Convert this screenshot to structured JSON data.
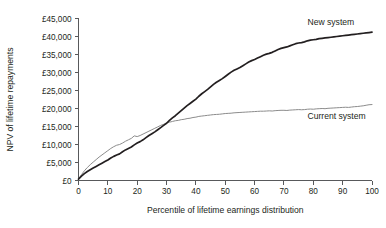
{
  "chart_data": {
    "type": "line",
    "title": "",
    "xlabel": "Percentile of lifetime earnings distribution",
    "ylabel": "NPV of lifetime repayments",
    "xlim": [
      0,
      100
    ],
    "ylim": [
      0,
      45000
    ],
    "grid": false,
    "legend_position": "inline-right",
    "x_ticks": [
      0,
      10,
      20,
      30,
      40,
      50,
      60,
      70,
      80,
      90,
      100
    ],
    "x_tick_labels": [
      "0",
      "10",
      "20",
      "30",
      "40",
      "50",
      "60",
      "70",
      "80",
      "90",
      "100"
    ],
    "y_ticks": [
      0,
      5000,
      10000,
      15000,
      20000,
      25000,
      30000,
      35000,
      40000,
      45000
    ],
    "y_tick_labels": [
      "£0",
      "£5,000",
      "£10,000",
      "£15,000",
      "£20,000",
      "£25,000",
      "£30,000",
      "£35,000",
      "£40,000",
      "£45,000"
    ],
    "series": [
      {
        "name": "New system",
        "color": "#231f20",
        "label_x": 78,
        "label_y": 43200,
        "x": [
          0,
          1,
          2,
          3,
          4,
          5,
          6,
          7,
          8,
          9,
          10,
          11,
          12,
          13,
          14,
          15,
          16,
          17,
          18,
          19,
          20,
          21,
          22,
          23,
          24,
          25,
          26,
          27,
          28,
          29,
          30,
          31,
          32,
          33,
          34,
          35,
          36,
          37,
          38,
          39,
          40,
          41,
          42,
          43,
          44,
          45,
          46,
          47,
          48,
          49,
          50,
          51,
          52,
          53,
          54,
          55,
          56,
          57,
          58,
          59,
          60,
          61,
          62,
          63,
          64,
          65,
          66,
          67,
          68,
          69,
          70,
          71,
          72,
          73,
          74,
          75,
          76,
          77,
          78,
          79,
          80,
          81,
          82,
          83,
          84,
          85,
          86,
          87,
          88,
          89,
          90,
          91,
          92,
          93,
          94,
          95,
          96,
          97,
          98,
          99,
          100
        ],
        "y": [
          400,
          1200,
          1900,
          2500,
          3000,
          3450,
          3900,
          4350,
          4800,
          5250,
          5700,
          6250,
          6700,
          7100,
          7400,
          8000,
          8500,
          8900,
          9300,
          9900,
          10400,
          10800,
          11300,
          11900,
          12500,
          13000,
          13500,
          14100,
          14700,
          15300,
          15900,
          16700,
          17400,
          18000,
          18700,
          19400,
          20100,
          20800,
          21400,
          22000,
          22600,
          23400,
          24100,
          24700,
          25300,
          26000,
          26700,
          27300,
          27800,
          28300,
          28900,
          29500,
          30100,
          30600,
          31000,
          31400,
          31900,
          32400,
          32900,
          33300,
          33600,
          34000,
          34400,
          34800,
          35100,
          35300,
          35600,
          36000,
          36400,
          36700,
          36900,
          37100,
          37400,
          37700,
          38000,
          38200,
          38300,
          38500,
          38800,
          39000,
          39100,
          39200,
          39400,
          39500,
          39600,
          39700,
          39800,
          39900,
          40000,
          40100,
          40200,
          40300,
          40400,
          40500,
          40600,
          40700,
          40800,
          40900,
          41000,
          41100,
          41200
        ]
      },
      {
        "name": "Current system",
        "color": "#8c8c8c",
        "label_x": 78,
        "label_y": 17200,
        "x": [
          0,
          1,
          2,
          3,
          4,
          5,
          6,
          7,
          8,
          9,
          10,
          11,
          12,
          13,
          14,
          15,
          16,
          17,
          18,
          19,
          20,
          21,
          22,
          23,
          24,
          25,
          26,
          27,
          28,
          29,
          30,
          31,
          32,
          33,
          34,
          35,
          36,
          37,
          38,
          39,
          40,
          41,
          42,
          43,
          44,
          45,
          46,
          47,
          48,
          49,
          50,
          51,
          52,
          53,
          54,
          55,
          56,
          57,
          58,
          59,
          60,
          61,
          62,
          63,
          64,
          65,
          66,
          67,
          68,
          69,
          70,
          71,
          72,
          73,
          74,
          75,
          76,
          77,
          78,
          79,
          80,
          81,
          82,
          83,
          84,
          85,
          86,
          87,
          88,
          89,
          90,
          91,
          92,
          93,
          94,
          95,
          96,
          97,
          98,
          99,
          100
        ],
        "y": [
          400,
          1600,
          2700,
          3600,
          4400,
          5100,
          5800,
          6500,
          7100,
          7700,
          8300,
          8900,
          9400,
          9800,
          10000,
          10400,
          10900,
          11300,
          11700,
          12400,
          12200,
          12500,
          12900,
          13300,
          13700,
          14100,
          14500,
          14900,
          15300,
          15600,
          15900,
          16200,
          16400,
          16600,
          16700,
          16900,
          17000,
          17200,
          17300,
          17500,
          17600,
          17800,
          17900,
          18000,
          18100,
          18200,
          18300,
          18350,
          18400,
          18500,
          18600,
          18650,
          18700,
          18800,
          18850,
          18900,
          18950,
          19000,
          19050,
          19100,
          19150,
          19200,
          19250,
          19250,
          19300,
          19350,
          19300,
          19400,
          19450,
          19500,
          19500,
          19450,
          19550,
          19600,
          19650,
          19700,
          19650,
          19700,
          19800,
          19850,
          19800,
          19900,
          19950,
          20000,
          19950,
          20050,
          20100,
          20150,
          20200,
          20250,
          20300,
          20350,
          20300,
          20400,
          20500,
          20550,
          20650,
          20750,
          20900,
          21050,
          21100
        ]
      }
    ]
  }
}
